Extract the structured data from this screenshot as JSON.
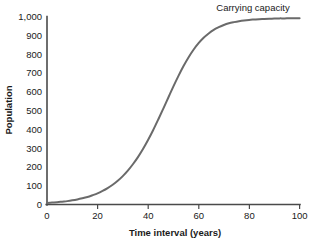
{
  "chart_data": {
    "type": "line",
    "title": "",
    "subtitle": "",
    "xlabel": "Time interval (years)",
    "ylabel": "Population",
    "xlim": [
      0,
      100
    ],
    "ylim": [
      0,
      1000
    ],
    "grid": false,
    "legend": "none",
    "line_color": "#6a6a6a",
    "axis_color": "#4a4a4a",
    "xticks": [
      0,
      20,
      40,
      60,
      80,
      100
    ],
    "xtick_labels": [
      "0",
      "20",
      "40",
      "60",
      "80",
      "100"
    ],
    "yticks": [
      0,
      100,
      200,
      300,
      400,
      500,
      600,
      700,
      800,
      900,
      1000
    ],
    "ytick_labels": [
      "0",
      "100",
      "200",
      "300",
      "400",
      "500",
      "600",
      "700",
      "800",
      "900",
      "1,000"
    ],
    "annotations": [
      {
        "text": "Carrying capacity",
        "x": 84,
        "y": 1055
      }
    ],
    "series": [
      {
        "name": "Population",
        "x": [
          0,
          2,
          4,
          6,
          8,
          10,
          12,
          14,
          16,
          18,
          20,
          22,
          24,
          26,
          28,
          30,
          32,
          34,
          36,
          38,
          40,
          42,
          44,
          46,
          48,
          50,
          52,
          54,
          56,
          58,
          60,
          62,
          64,
          66,
          68,
          70,
          72,
          74,
          76,
          78,
          80,
          82,
          84,
          86,
          88,
          90,
          92,
          94,
          96,
          98,
          100
        ],
        "values": [
          8,
          10,
          12,
          15,
          18,
          22,
          27,
          33,
          40,
          49,
          59,
          72,
          87,
          105,
          126,
          151,
          180,
          214,
          252,
          295,
          343,
          395,
          451,
          509,
          568,
          627,
          683,
          735,
          782,
          823,
          858,
          887,
          910,
          929,
          943,
          955,
          964,
          970,
          975,
          979,
          982,
          984,
          986,
          987,
          988,
          989,
          990,
          990,
          991,
          991,
          991
        ]
      }
    ]
  },
  "axes": {
    "ylabel_text": "Population",
    "xlabel_text": "Time interval (years)"
  },
  "ticks": {
    "y": {
      "t1000": "1,000",
      "t900": "900",
      "t800": "800",
      "t700": "700",
      "t600": "600",
      "t500": "500",
      "t400": "400",
      "t300": "300",
      "t200": "200",
      "t100": "100",
      "t0": "0"
    },
    "x": {
      "t0": "0",
      "t20": "20",
      "t40": "40",
      "t60": "60",
      "t80": "80",
      "t100": "100"
    }
  },
  "annotation": {
    "carrying_capacity": "Carrying capacity"
  }
}
